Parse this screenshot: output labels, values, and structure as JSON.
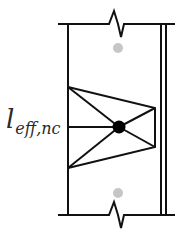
{
  "diagram": {
    "label": {
      "main": "l",
      "subscript": "eff,nc"
    },
    "colors": {
      "stroke": "#111111",
      "node": "#000000",
      "anchor_dot": "#c6c6c6"
    },
    "elements": {
      "top_boundary": "broken line with zigzag break",
      "bottom_boundary": "broken line with zigzag break",
      "left_edge": "vertical line",
      "right_edge": "double vertical line",
      "truss": "trapezoid strut-and-tie with central node",
      "anchor_dots": 2
    }
  }
}
